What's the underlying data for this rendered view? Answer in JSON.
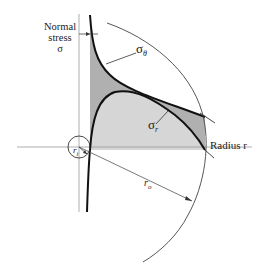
{
  "figure": {
    "type": "stress-distribution-diagram",
    "y_axis_label": [
      "Normal",
      "stress",
      "σ"
    ],
    "x_axis_label": "Radius r",
    "curves": [
      {
        "name": "sigma_theta",
        "label_main": "σ",
        "label_sub": "θ",
        "description": "tangential (hoop) stress, decreasing with radius"
      },
      {
        "name": "sigma_r",
        "label_main": "σ",
        "label_sub": "r",
        "description": "radial stress, zero at inner and outer radii"
      }
    ],
    "dimensions": {
      "inner_radius_label": "r",
      "inner_radius_sub": "i",
      "outer_radius_label": "r",
      "outer_radius_sub": "o"
    },
    "colors": {
      "dark_fill": "#b0b0b0",
      "light_fill": "#d6d6d6",
      "curve": "#111111",
      "axis": "#888888"
    }
  }
}
